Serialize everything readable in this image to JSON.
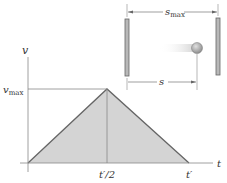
{
  "diagram": {
    "type": "velocity-time graph with motion illustration",
    "axes": {
      "y_label": "v",
      "x_label": "t",
      "y_tick": "v",
      "y_tick_sub": "max",
      "x_ticks": [
        "t′/2",
        "t′"
      ]
    },
    "illustration": {
      "top_dimension": "s",
      "top_dimension_sub": "max",
      "bottom_dimension": "s"
    },
    "colors": {
      "fill": "#d4d4d4",
      "line": "#555555",
      "axis": "#888888",
      "wall": "#b0b0b0"
    }
  }
}
